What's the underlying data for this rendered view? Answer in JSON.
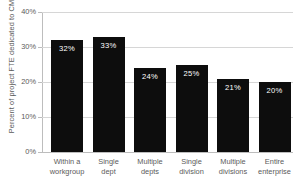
{
  "chart_data": {
    "type": "bar",
    "title": "",
    "xlabel": "",
    "ylabel": "Percent of project FTE dedicated to CM",
    "ylim": [
      0,
      40
    ],
    "grid": true,
    "legend": false,
    "categories": [
      "Within a workgroup",
      "Single dept",
      "Multiple depts",
      "Single division",
      "Multiple divisions",
      "Entire enterprise"
    ],
    "category_lines": [
      [
        "Within a",
        "workgroup"
      ],
      [
        "Single",
        "dept"
      ],
      [
        "Multiple",
        "depts"
      ],
      [
        "Single",
        "division"
      ],
      [
        "Multiple",
        "divisions"
      ],
      [
        "Entire",
        "enterprise"
      ]
    ],
    "values": [
      32,
      33,
      24,
      25,
      21,
      20
    ],
    "data_labels": [
      "32%",
      "33%",
      "24%",
      "25%",
      "21%",
      "20%"
    ],
    "ytick_values": [
      40,
      30,
      20,
      10,
      0
    ],
    "ytick_labels": [
      "40%",
      "30%",
      "20%",
      "10%",
      "0%"
    ],
    "bar_color": "#0d0d0d",
    "data_label_color": "#ffffff",
    "gridline_color": "#d6d6d6",
    "axis_color": "#bdbdbd",
    "text_color": "#5a5a5a",
    "plot_background": "#ffffff"
  },
  "cutoff_title": ""
}
